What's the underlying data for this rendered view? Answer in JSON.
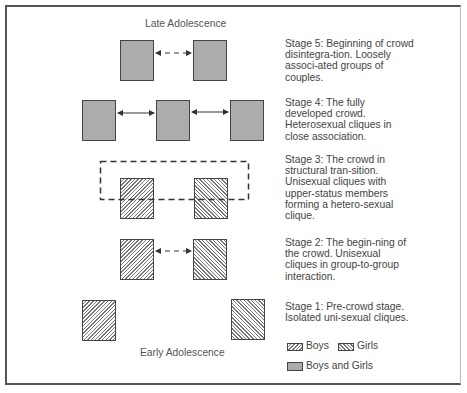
{
  "diagram": {
    "top_label": "Late Adolescence",
    "bottom_label": "Early Adolescence",
    "stages": [
      {
        "id": 5,
        "text": "Stage 5:  Beginning of crowd disintegra-tion.  Loosely associ-ated groups of couples."
      },
      {
        "id": 4,
        "text": "Stage 4:  The fully developed crowd. Heterosexual cliques in close association."
      },
      {
        "id": 3,
        "text": "Stage 3:  The crowd in structural tran-sition. Unisexual cliques with upper-status members forming a hetero-sexual clique."
      },
      {
        "id": 2,
        "text": "Stage 2:  The begin-ning of the crowd. Unisexual cliques in group-to-group interaction."
      },
      {
        "id": 1,
        "text": "Stage 1:  Pre-crowd stage. Isolated uni-sexual cliques."
      }
    ],
    "legend": {
      "boys": "Boys",
      "girls": "Girls",
      "mixed": "Boys and Girls"
    },
    "colors": {
      "mixed_fill": "#acacac",
      "outline": "#444444",
      "hatch": "#777777"
    }
  }
}
